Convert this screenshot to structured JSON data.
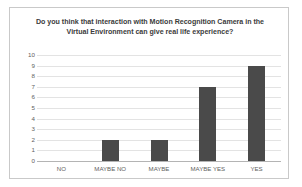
{
  "chart_data": {
    "type": "bar",
    "title": "Do you think that interaction with Motion Recognition Camera in the Virtual Environment can give real life experience?",
    "title_line1": "Do you think that interaction with Motion Recognition Camera in the",
    "title_line2": "Virtual Environment can give real life experience?",
    "categories": [
      "NO",
      "MAYBE NO",
      "MAYBE",
      "MAYBE YES",
      "YES"
    ],
    "values": [
      0,
      2,
      2,
      7,
      9
    ],
    "xlabel": "",
    "ylabel": "",
    "ylim": [
      0,
      10
    ],
    "y_ticks": [
      10,
      9,
      8,
      7,
      6,
      5,
      4,
      3,
      2,
      1,
      0
    ],
    "grid": true,
    "legend": false,
    "bar_color": "#4a4a4a",
    "gridline_color": "#e3e3e3",
    "axis_color": "#b4b4b4",
    "label_color": "#5e5e5e",
    "title_color": "#3b3b3b",
    "border_color": "#c9c9c9",
    "background": "#ffffff"
  }
}
